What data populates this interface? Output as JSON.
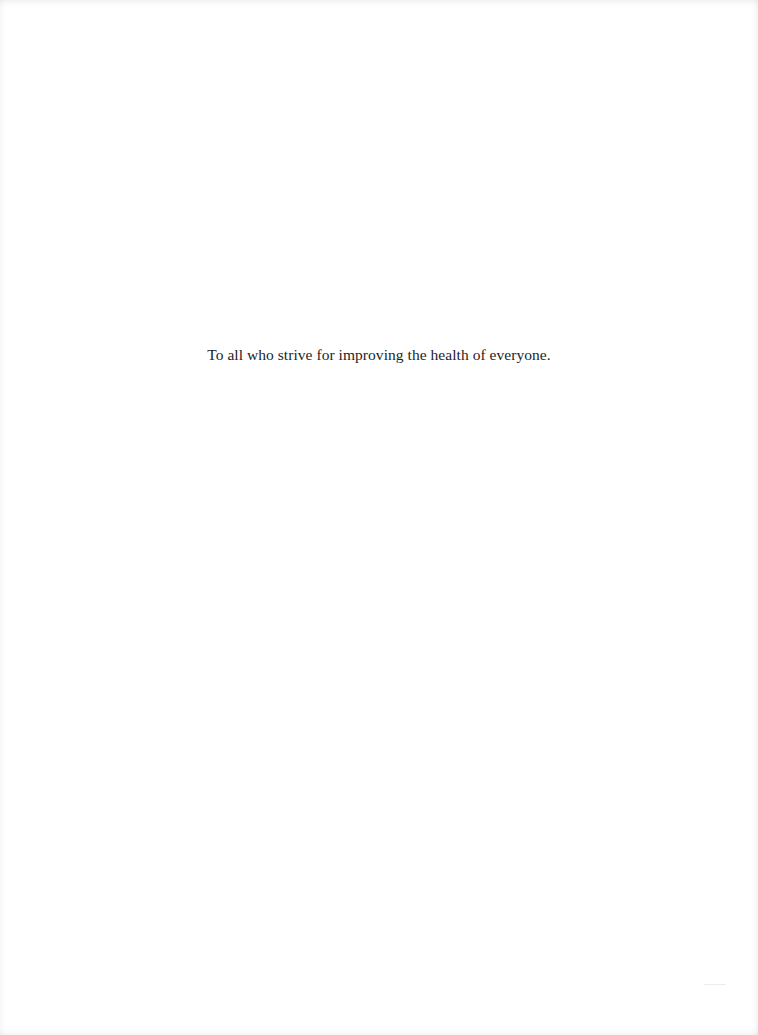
{
  "page": {
    "type": "dedication",
    "dedication_text": "To all who strive for improving the health of everyone."
  }
}
